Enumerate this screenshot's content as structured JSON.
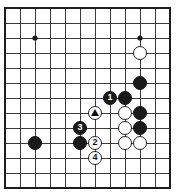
{
  "diagram": {
    "kind": "go-board-diagram",
    "board": {
      "cols": 12,
      "rows": 13,
      "origin_x": 5,
      "origin_y": 8,
      "spacing_x": 15,
      "spacing_y": 15,
      "line_color": "#3a3a3a",
      "border_color": "#1e1e1e",
      "background_color": "#ffffff",
      "star_point_color": "#1a1a1a",
      "star_point_radius": 2.6,
      "star_points": [
        {
          "col": 2,
          "row": 2
        },
        {
          "col": 9,
          "row": 2
        },
        {
          "col": 2,
          "row": 9
        }
      ]
    },
    "stone_radius": 7.4,
    "colors": {
      "black_stone": "#1a1a1a",
      "white_stone": "#ffffff",
      "black_label": "#ffffff",
      "white_label": "#111111",
      "marker": "#111111"
    },
    "stones": [
      {
        "id": "w-top-right",
        "color": "white",
        "col": 9,
        "row": 3,
        "label": "",
        "marker": ""
      },
      {
        "id": "b-right-upper",
        "color": "black",
        "col": 9,
        "row": 5,
        "label": "",
        "marker": ""
      },
      {
        "id": "b-move-1",
        "color": "black",
        "col": 7,
        "row": 6,
        "label": "1",
        "marker": ""
      },
      {
        "id": "b-center-right",
        "color": "black",
        "col": 8,
        "row": 6,
        "label": "",
        "marker": ""
      },
      {
        "id": "w-marked",
        "color": "white",
        "col": 6,
        "row": 7,
        "label": "",
        "marker": "triangle"
      },
      {
        "id": "w-inner-upper",
        "color": "white",
        "col": 8,
        "row": 7,
        "label": "",
        "marker": ""
      },
      {
        "id": "b-right-mid",
        "color": "black",
        "col": 9,
        "row": 7,
        "label": "",
        "marker": ""
      },
      {
        "id": "b-move-3",
        "color": "black",
        "col": 5,
        "row": 8,
        "label": "3",
        "marker": ""
      },
      {
        "id": "w-inner-lower",
        "color": "white",
        "col": 8,
        "row": 8,
        "label": "",
        "marker": ""
      },
      {
        "id": "b-right-lower",
        "color": "black",
        "col": 9,
        "row": 8,
        "label": "",
        "marker": ""
      },
      {
        "id": "b-lower-left",
        "color": "black",
        "col": 2,
        "row": 9,
        "label": "",
        "marker": ""
      },
      {
        "id": "b-lower-mid",
        "color": "black",
        "col": 5,
        "row": 9,
        "label": "",
        "marker": ""
      },
      {
        "id": "w-move-2",
        "color": "white",
        "col": 6,
        "row": 9,
        "label": "2",
        "marker": ""
      },
      {
        "id": "w-bottom-inner",
        "color": "white",
        "col": 8,
        "row": 9,
        "label": "",
        "marker": ""
      },
      {
        "id": "w-bottom-right",
        "color": "white",
        "col": 9,
        "row": 9,
        "label": "",
        "marker": ""
      },
      {
        "id": "w-move-4",
        "color": "white",
        "col": 6,
        "row": 10,
        "label": "4",
        "marker": ""
      }
    ]
  }
}
